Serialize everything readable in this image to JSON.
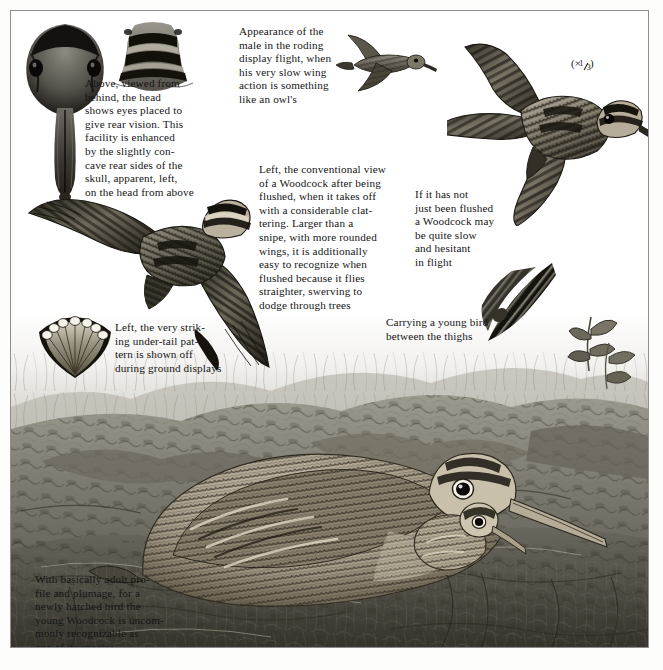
{
  "page": {
    "subject": "Woodcock",
    "width": 663,
    "height": 670,
    "background_color": "#ffffff",
    "frame_color": "#8d8d8d",
    "text_color": "#151515"
  },
  "scale_note": {
    "prefix": "(×",
    "numerator": "1",
    "denominator": "3",
    "suffix": ")",
    "full_text": "(× 1/3)"
  },
  "captions": [
    {
      "id": "head-from-behind",
      "text": "Above, viewed from\nbehind, the head\nshows eyes placed to\ngive rear vision. This\nfacility is enhanced\nby the slightly con-\ncave rear sides of the\nskull, apparent, left,\non the head from above"
    },
    {
      "id": "roding-display-flight",
      "text": "Appearance of the\nmale in the roding\ndisplay flight, when\nhis very slow wing\naction is something\nlike an owl's"
    },
    {
      "id": "conventional-flushed-view",
      "text": "Left, the conventional view\nof a Woodcock after being\nflushed, when it takes off\nwith a considerable clat-\ntering. Larger than a\nsnipe, with more rounded\nwings, it is additionally\neasy to recognize when\nflushed because it flies\nstraighter, swerving to\ndodge through trees"
    },
    {
      "id": "slow-hesitant-flight",
      "text": "If it has not\njust been flushed\na Woodcock may\nbe quite slow\nand hesitant\nin flight"
    },
    {
      "id": "under-tail-pattern",
      "text": "Left, the very strik-\ning under-tail pat-\ntern is shown off\nduring ground displays"
    },
    {
      "id": "carrying-young",
      "text": "Carrying a young bird\nbetween the thighs"
    },
    {
      "id": "young-woodcock",
      "text": "With basically adult pro-\nfile and plumage, for a\nnewly hatched bird the\nyoung Woodcock is uncom-\nmonly recognizable as\none of its species"
    }
  ],
  "illustrations": [
    {
      "id": "head-from-above",
      "label": "woodcock head viewed from above with long bill"
    },
    {
      "id": "head-from-behind",
      "label": "woodcock head viewed from behind showing banded crown"
    },
    {
      "id": "roding-flight-bird",
      "label": "small woodcock in roding display flight"
    },
    {
      "id": "flushed-flight-bird-large",
      "label": "large woodcock in flight seen from above"
    },
    {
      "id": "flushed-flight-bird-left",
      "label": "woodcock in flight seen from above, wings spread"
    },
    {
      "id": "under-tail-fan",
      "label": "woodcock spread tail showing white under-tail tips"
    },
    {
      "id": "carrying-young-bird",
      "label": "woodcock in flight carrying a young bird between thighs"
    },
    {
      "id": "ground-scene",
      "label": "adult woodcock crouched among leaf litter with chick"
    }
  ]
}
